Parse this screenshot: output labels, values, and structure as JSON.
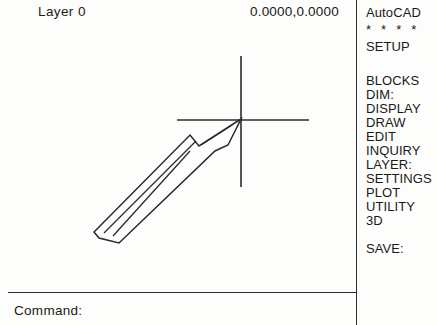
{
  "app": {
    "title": "AutoCAD",
    "background_color": "#fdfdfc",
    "ink_color": "#1a1a1a"
  },
  "status_bar": {
    "layer_label": "Layer 0",
    "coordinates": "0.0000,0.0000"
  },
  "command_prompt": {
    "label": "Command:"
  },
  "side_menu": {
    "header": "AutoCAD",
    "stars": "* * * *",
    "items": [
      {
        "label": "SETUP",
        "y": 40,
        "type": "item"
      },
      {
        "label": "BLOCKS",
        "y": 74,
        "type": "item"
      },
      {
        "label": "DIM:",
        "y": 88,
        "type": "item"
      },
      {
        "label": "DISPLAY",
        "y": 102,
        "type": "item"
      },
      {
        "label": "DRAW",
        "y": 116,
        "type": "item"
      },
      {
        "label": "EDIT",
        "y": 130,
        "type": "item"
      },
      {
        "label": "INQUIRY",
        "y": 144,
        "type": "item"
      },
      {
        "label": "LAYER:",
        "y": 158,
        "type": "item"
      },
      {
        "label": "SETTINGS",
        "y": 172,
        "type": "item"
      },
      {
        "label": "PLOT",
        "y": 186,
        "type": "item"
      },
      {
        "label": "UTILITY",
        "y": 200,
        "type": "item"
      },
      {
        "label": "3D",
        "y": 214,
        "type": "item"
      },
      {
        "label": "SAVE:",
        "y": 242,
        "type": "item"
      }
    ]
  },
  "drawing": {
    "crosshair": {
      "center_x": 241,
      "center_y": 120,
      "h_x1": 177,
      "h_x2": 309,
      "v_y1": 56,
      "v_y2": 187
    },
    "arrow_outer_path": "M 241 119 L 199 146 L 190 135 L 98 228 L 94 232 L 99 238 L 119 243 L 215 151 L 228 145 Z",
    "arrow_inner_path": "M 232 125 L 201 145 M 196 141 L 104 233 M 190 151 L 113 236"
  }
}
